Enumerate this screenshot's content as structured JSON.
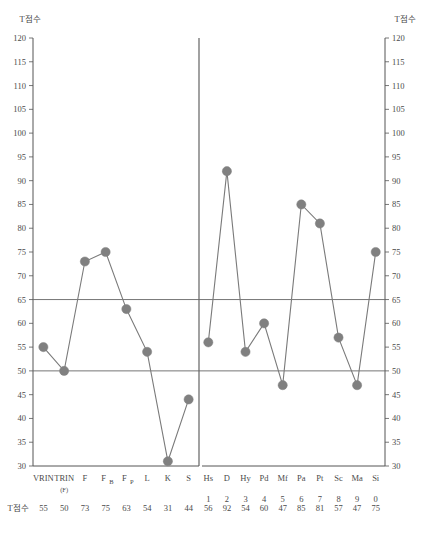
{
  "axis_titles": {
    "left": "T점수",
    "right": "T점수"
  },
  "row_label": "T점수",
  "y_ticks": [
    120,
    115,
    110,
    105,
    100,
    95,
    90,
    85,
    80,
    75,
    70,
    65,
    60,
    55,
    50,
    45,
    40,
    35,
    30
  ],
  "reference_lines": [
    65,
    50
  ],
  "colors": {
    "marker": "#808080",
    "line": "#7a7a7a",
    "axis": "#555555",
    "reference": "#666666",
    "text": "#4a4a4a"
  },
  "chart_data": {
    "type": "line",
    "title": "",
    "xlabel": "",
    "ylabel": "T점수",
    "ylim": [
      30,
      120
    ],
    "grid": false,
    "legend": "none",
    "reference_lines": [
      65,
      50
    ],
    "panels": [
      {
        "name": "validity-scales",
        "categories": [
          "VRIN",
          "TRIN",
          "F",
          "FB",
          "FP",
          "L",
          "K",
          "S"
        ],
        "category_labels": [
          "VRIN",
          "TRIN",
          "F",
          "F",
          "F",
          "L",
          "K",
          "S"
        ],
        "category_subs": [
          "",
          "(F)",
          "",
          "B",
          "P",
          "",
          "",
          ""
        ],
        "codes": [
          "",
          "",
          "",
          "",
          "",
          "",
          "",
          ""
        ],
        "values": [
          55,
          50,
          73,
          75,
          63,
          54,
          31,
          44
        ]
      },
      {
        "name": "clinical-scales",
        "categories": [
          "Hs",
          "D",
          "Hy",
          "Pd",
          "Mf",
          "Pa",
          "Pt",
          "Sc",
          "Ma",
          "Si"
        ],
        "category_labels": [
          "Hs",
          "D",
          "Hy",
          "Pd",
          "Mf",
          "Pa",
          "Pt",
          "Sc",
          "Ma",
          "Si"
        ],
        "category_subs": [
          "",
          "",
          "",
          "",
          "",
          "",
          "",
          "",
          "",
          ""
        ],
        "codes": [
          "1",
          "2",
          "3",
          "4",
          "5",
          "6",
          "7",
          "8",
          "9",
          "0"
        ],
        "values": [
          56,
          92,
          54,
          60,
          47,
          85,
          81,
          57,
          47,
          75
        ]
      }
    ]
  }
}
